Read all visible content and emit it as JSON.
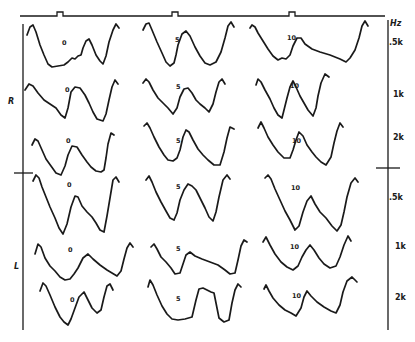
{
  "figure": {
    "ear_labels": [
      {
        "text": "R",
        "x": 8,
        "y": 104
      },
      {
        "text": "L",
        "x": 14,
        "y": 269
      }
    ],
    "frequency_unit": {
      "text": "Hz",
      "x": 390,
      "y": 26
    },
    "frequency_labels": [
      {
        "text": ".5k",
        "x": 389,
        "y": 45
      },
      {
        "text": "1k",
        "x": 393,
        "y": 97
      },
      {
        "text": "2k",
        "x": 393,
        "y": 140
      },
      {
        "text": ".5k",
        "x": 389,
        "y": 200
      },
      {
        "text": "1k",
        "x": 395,
        "y": 249
      },
      {
        "text": "2k",
        "x": 395,
        "y": 300
      }
    ],
    "column_labels": [
      "0",
      "5",
      "10"
    ],
    "top_line": {
      "x1": 20,
      "x2": 385,
      "y": 16,
      "markers": [
        60,
        175,
        292
      ]
    },
    "left_axis": {
      "x": 23,
      "y1": 24,
      "y2": 330,
      "tick_y": 173,
      "tick_x1": 14,
      "tick_x2": 33
    },
    "right_axis": {
      "x": 388,
      "y1": 20,
      "y2": 330,
      "tick_y": 168,
      "tick_x1": 376,
      "tick_x2": 400
    },
    "rows": [
      {
        "ear": "R",
        "frequency": ".5k",
        "cells": [
          {
            "label": "0",
            "label_x": 62,
            "label_y": 45,
            "points": "27,35 30,27 33,25 36,32 40,45 44,55 48,64 52,67 58,66 64,65 68,62 72,58 75,59 78,56 81,55 83,48 86,41 89,39 92,45 96,55 100,61 103,64 106,56 109,42 113,30 116,24 119,28"
          },
          {
            "label": "5",
            "label_x": 175,
            "label_y": 42,
            "points": "143,30 146,24 149,23 152,30 157,42 162,53 166,62 170,66 174,63 176,55 178,45 182,34 186,31 190,36 195,47 200,56 205,63 210,65 216,62 221,52 225,38 228,26 231,22 234,27"
          },
          {
            "label": "10",
            "label_x": 287,
            "label_y": 40,
            "points": "250,28 252,25 255,27 258,33 263,41 268,49 273,56 278,60 282,58 286,59 290,55 293,46 297,38 301,38 305,44 312,49 320,52 330,55 340,59 346,62 350,58 355,50 359,38 362,26 365,21 368,26"
          }
        ]
      },
      {
        "ear": "R",
        "frequency": "1k",
        "cells": [
          {
            "label": "0",
            "label_x": 65,
            "label_y": 92,
            "points": "25,90 29,84 33,86 38,93 44,100 50,104 56,108 61,115 65,118 68,108 71,92 75,87 80,88 85,95 89,103 93,112 97,119 103,121 106,114 109,100 112,87 115,80 118,84"
          },
          {
            "label": "5",
            "label_x": 176,
            "label_y": 89,
            "points": "143,83 146,79 149,82 153,90 158,98 163,103 168,108 173,114 177,108 180,97 184,89 188,88 192,93 196,100 200,104 205,108 209,112 213,104 216,92 219,82 222,79 225,84"
          },
          {
            "label": "10",
            "label_x": 290,
            "label_y": 88,
            "points": "256,85 258,79 261,82 265,90 270,99 274,108 278,115 282,118 284,110 287,98 290,87 293,81 296,87 300,96 304,103 308,110 313,116 316,108 318,96 321,83 325,74 329,77"
          }
        ]
      },
      {
        "ear": "R",
        "frequency": "2k",
        "cells": [
          {
            "label": "0",
            "label_x": 66,
            "label_y": 143,
            "points": "32,145 35,139 38,141 42,150 46,159 51,166 56,173 61,175 65,166 68,155 72,146 77,147 82,155 87,162 91,167 96,171 101,172 104,170 106,158 108,144 111,133 114,135"
          },
          {
            "label": "5",
            "label_x": 176,
            "label_y": 143,
            "points": "144,126 147,123 150,128 154,137 159,147 164,155 168,160 173,161 177,158 180,150 183,137 186,130 189,132 193,140 198,149 203,155 208,160 214,165 220,165 224,152 227,138 230,127 234,129"
          },
          {
            "label": "10",
            "label_x": 292,
            "label_y": 143,
            "points": "258,128 261,122 264,128 268,137 273,145 278,152 284,158 290,158 293,150 296,140 299,132 303,136 307,145 312,152 316,157 321,162 326,165 331,157 334,143 337,131 340,123 343,127"
          }
        ]
      },
      {
        "ear": "L",
        "frequency": ".5k",
        "cells": [
          {
            "label": "0",
            "label_x": 67,
            "label_y": 187,
            "points": "33,181 36,175 39,178 42,187 46,197 50,207 55,218 59,228 63,234 67,224 71,207 75,196 78,197 82,206 87,212 92,217 96,223 100,230 104,232 107,216 110,198 113,180 116,177 119,182"
          },
          {
            "label": "5",
            "label_x": 176,
            "label_y": 189,
            "points": "146,180 149,176 152,182 156,192 161,202 166,211 170,218 174,220 177,213 180,200 184,190 188,184 192,186 196,190 200,198 205,208 209,217 213,221 216,212 219,197 223,180 227,175 230,179"
          },
          {
            "label": "10",
            "label_x": 291,
            "label_y": 190,
            "points": "265,178 268,175 271,179 275,189 280,200 285,211 290,220 295,230 299,226 303,212 307,201 311,196 315,204 320,212 326,218 332,226 337,231 341,225 344,212 347,197 351,183 355,178 358,182"
          }
        ]
      },
      {
        "ear": "L",
        "frequency": "1k",
        "cells": [
          {
            "label": "0",
            "label_x": 68,
            "label_y": 252,
            "points": "35,254 38,244 41,247 45,258 50,266 55,271 60,277 65,280 70,279 74,274 78,268 83,258 88,254 93,259 100,265 107,270 112,273 117,276 121,271 124,259 127,248 130,243 133,247"
          },
          {
            "label": "5",
            "label_x": 176,
            "label_y": 251,
            "points": "151,247 154,244 157,249 161,257 166,262 171,268 175,274 180,273 183,264 186,255 190,252 195,256 202,259 210,262 218,265 225,270 230,274 235,273 238,260 241,246 244,240 247,242"
          },
          {
            "label": "10",
            "label_x": 290,
            "label_y": 249,
            "points": "263,242 266,237 270,245 275,254 281,262 287,267 293,270 298,266 302,257 306,250 310,245 314,250 319,258 324,264 330,268 336,266 340,257 344,245 348,236 351,241"
          }
        ]
      },
      {
        "ear": "L",
        "frequency": "2k",
        "cells": [
          {
            "label": "0",
            "label_x": 70,
            "label_y": 302,
            "points": "40,291 43,283 46,286 50,295 55,307 60,317 64,322 68,325 71,319 75,308 79,297 84,292 88,300 92,308 97,313 101,310 104,297 107,286 110,284 113,290"
          },
          {
            "label": "5",
            "label_x": 176,
            "label_y": 301,
            "points": "148,287 150,280 153,285 157,295 162,306 167,314 172,319 178,320 185,319 192,317 196,300 199,289 203,288 207,290 211,292 214,293 217,308 219,318 224,322 229,320 232,303 235,290 238,284 241,287"
          },
          {
            "label": "10",
            "label_x": 292,
            "label_y": 298,
            "points": "264,289 266,285 269,291 273,298 279,305 285,310 291,313 296,316 301,308 304,297 307,291 311,296 317,302 324,307 331,311 336,313 340,305 343,292 347,281 352,277 357,282"
          }
        ]
      }
    ]
  }
}
